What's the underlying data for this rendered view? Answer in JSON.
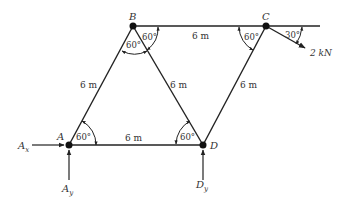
{
  "diagram": {
    "type": "truss",
    "nodes": {
      "A": {
        "label": "A",
        "x": 69,
        "y": 145
      },
      "B": {
        "label": "B",
        "x": 133,
        "y": 26
      },
      "C": {
        "label": "C",
        "x": 266,
        "y": 26
      },
      "D": {
        "label": "D",
        "x": 203,
        "y": 145
      }
    },
    "members": [
      {
        "from": "A",
        "to": "B",
        "length": "6 m"
      },
      {
        "from": "B",
        "to": "C",
        "length": "6 m"
      },
      {
        "from": "B",
        "to": "D",
        "length": "6 m"
      },
      {
        "from": "A",
        "to": "D",
        "length": "6 m"
      },
      {
        "from": "C",
        "to": "D",
        "length": "6 m"
      }
    ],
    "member_labels": {
      "AB": "6 m",
      "BC": "6 m",
      "BD": "6 m",
      "AD": "6 m",
      "CD": "6 m"
    },
    "angles": {
      "A": "60°",
      "B_left": "60°",
      "B_right": "60°",
      "C": "60°",
      "D": "60°",
      "load": "30°"
    },
    "load": {
      "label": "2 kN",
      "angle": "30°"
    },
    "reactions": {
      "Ax": "A",
      "Ax_sub": "x",
      "Ay": "A",
      "Ay_sub": "y",
      "Dy": "D",
      "Dy_sub": "y"
    }
  }
}
